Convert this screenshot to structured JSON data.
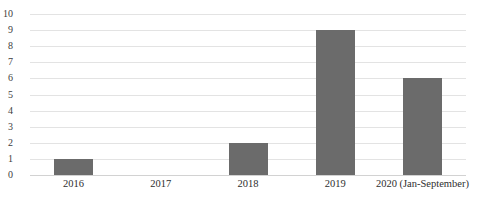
{
  "chart_data": {
    "type": "bar",
    "title": "",
    "xlabel": "",
    "ylabel": "",
    "categories": [
      "2016",
      "2017",
      "2018",
      "2019",
      "2020 (Jan-September)"
    ],
    "values": [
      1,
      0,
      2,
      9,
      6
    ],
    "ylim": [
      0,
      10
    ],
    "ytick_labels": [
      "10",
      "9",
      "8",
      "7",
      "6",
      "5",
      "4",
      "3",
      "2",
      "1",
      "0"
    ],
    "ytick_values": [
      10,
      9,
      8,
      7,
      6,
      5,
      4,
      3,
      2,
      1,
      0
    ],
    "grid": true,
    "legend": false,
    "series": [
      {
        "name": "",
        "values": [
          1,
          0,
          2,
          9,
          6
        ]
      }
    ],
    "colors": {
      "bar": "#6b6b6b",
      "gridline": "#e3e3e3",
      "baseline": "#d2d2d2",
      "tick_label": "#2e2e2e",
      "background": "#ffffff"
    }
  }
}
